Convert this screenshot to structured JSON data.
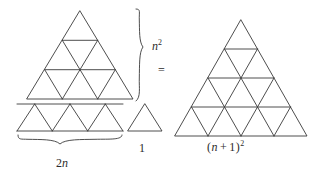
{
  "figure": {
    "kind": "proof-without-words",
    "line_color": "#3a3a3a",
    "text_color": "#2b2b2b",
    "background_color": "#ffffff"
  },
  "labels": {
    "n_squared": "n",
    "n_squared_exponent": "2",
    "equals": "=",
    "two_n_coefficient": "2",
    "two_n_variable": "n",
    "one": "1",
    "n_plus_one_open": "(",
    "n_plus_one_var": "n",
    "n_plus_one_plus": "+",
    "n_plus_one_value": "1",
    "n_plus_one_close": ")",
    "n_plus_one_exponent": "2"
  },
  "shapes": {
    "upper_triangle": {
      "name": "n-squared-triangle",
      "rows": 3,
      "small_triangle_count": 9,
      "apex_x": 80,
      "apex_y": 11,
      "base_left_x": 27,
      "base_right_x": 133,
      "base_y": 99
    },
    "strip": {
      "name": "two-n-strip",
      "triangle_count": 6,
      "left_x": 17,
      "right_x": 123,
      "top_y": 104,
      "bottom_y": 131
    },
    "unit_triangle": {
      "name": "unit-triangle",
      "triangle_count": 1,
      "apex_x": 145,
      "apex_y": 104,
      "base_left_x": 128,
      "base_right_x": 162,
      "base_y": 131
    },
    "result_triangle": {
      "name": "n-plus-one-squared-triangle",
      "rows": 4,
      "small_triangle_count": 16,
      "apex_x": 241,
      "apex_y": 20,
      "base_left_x": 175,
      "base_right_x": 307,
      "base_y": 136
    }
  },
  "braces": {
    "right_brace": {
      "name": "n-squared-brace",
      "orientation": "vertical",
      "top_y": 9,
      "bottom_y": 101,
      "x": 140
    },
    "bottom_brace": {
      "name": "two-n-brace",
      "orientation": "horizontal",
      "left_x": 18,
      "right_x": 122,
      "y": 137
    }
  }
}
